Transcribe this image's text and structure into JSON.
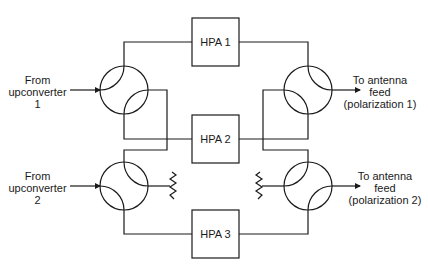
{
  "diagram": {
    "type": "block-diagram",
    "colors": {
      "stroke": "#1a1a1a",
      "background": "#ffffff"
    },
    "amplifiers": [
      {
        "id": "hpa1",
        "label": "HPA 1"
      },
      {
        "id": "hpa2",
        "label": "HPA 2"
      },
      {
        "id": "hpa3",
        "label": "HPA 3"
      }
    ],
    "inputs": [
      {
        "id": "in1",
        "line1": "From",
        "line2": "upconverter",
        "line3": "1"
      },
      {
        "id": "in2",
        "line1": "From",
        "line2": "upconverter",
        "line3": "2"
      }
    ],
    "outputs": [
      {
        "id": "out1",
        "line1": "To antenna",
        "line2": "feed",
        "line3": "(polarization 1)"
      },
      {
        "id": "out2",
        "line1": "To antenna",
        "line2": "feed",
        "line3": "(polarization 2)"
      }
    ],
    "hybrids": [
      {
        "id": "left-hybrid-1"
      },
      {
        "id": "left-hybrid-2"
      },
      {
        "id": "right-hybrid-1"
      },
      {
        "id": "right-hybrid-2"
      }
    ],
    "terminations": [
      {
        "id": "left-termination",
        "icon": "resistor-load-icon"
      },
      {
        "id": "right-termination",
        "icon": "resistor-load-icon"
      }
    ]
  }
}
